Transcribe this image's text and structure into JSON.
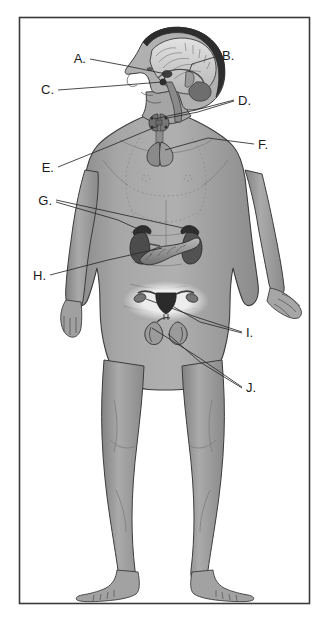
{
  "figure": {
    "background_color": "#ffffff",
    "frame": {
      "name": "figure-border",
      "x": 19,
      "y": 17,
      "width": 291,
      "height": 587,
      "stroke_color": "#3a3a3a",
      "stroke_width": 1.6,
      "fill_color": "#ffffff"
    },
    "palette": {
      "skin_base": "#9b9b9b",
      "skin_light": "#b4b4b4",
      "skin_shadow": "#7d7d7d",
      "skin_highlight": "#c6c6c6",
      "outline": "#3c3c3c",
      "organ_dark": "#4a4a4a",
      "organ_mid": "#6f6f6f",
      "organ_light": "#cfcfcf",
      "brain_light": "#d3d3d3",
      "hair_dark": "#2a2a2a",
      "halo": "#e8e8e8",
      "label_color": "#1a1a1a",
      "leader_color": "#2b2b2b",
      "dotted_guide": "#848484"
    },
    "labels": [
      {
        "id": "A",
        "text": "A.",
        "x": 86,
        "y": 62,
        "anchor": "end",
        "target_x": 167,
        "target_y": 74,
        "organ": "hypothalamus"
      },
      {
        "id": "B",
        "text": "B.",
        "x": 222,
        "y": 60,
        "anchor": "start",
        "target_x": 163,
        "target_y": 75,
        "organ": "pineal-gland"
      },
      {
        "id": "C",
        "text": "C.",
        "x": 52,
        "y": 94,
        "anchor": "end",
        "target_x": 162,
        "target_y": 73,
        "organ": "pituitary-gland"
      },
      {
        "id": "D",
        "text": "D.",
        "x": 238,
        "y": 104,
        "anchor": "start",
        "target_x": 156,
        "target_y": 123,
        "organ": "parathyroid-glands"
      },
      {
        "id": "E",
        "text": "E.",
        "x": 52,
        "y": 172,
        "anchor": "end",
        "target_x": 159,
        "target_y": 124,
        "organ": "thyroid-gland"
      },
      {
        "id": "F",
        "text": "F.",
        "x": 258,
        "y": 148,
        "anchor": "start",
        "target_x": 158,
        "target_y": 133,
        "organ": "thymus"
      },
      {
        "id": "G",
        "text": "G.",
        "x": 50,
        "y": 205,
        "anchor": "end",
        "target_x": 181,
        "target_y": 230,
        "organ": "adrenal-glands"
      },
      {
        "id": "H",
        "text": "H.",
        "x": 44,
        "y": 280,
        "anchor": "end",
        "target_x": 159,
        "target_y": 243,
        "organ": "pancreas"
      },
      {
        "id": "I",
        "text": "I.",
        "x": 246,
        "y": 337,
        "anchor": "start",
        "target_x": 148,
        "target_y": 303,
        "organ": "ovaries"
      },
      {
        "id": "J",
        "text": "J.",
        "x": 246,
        "y": 392,
        "anchor": "start",
        "target_x": 152,
        "target_y": 326,
        "organ": "testes"
      }
    ],
    "organs": [
      {
        "name": "hypothalamus",
        "region": "brain-sagittal-section"
      },
      {
        "name": "pineal-gland",
        "region": "brain-sagittal-section"
      },
      {
        "name": "pituitary-gland",
        "region": "brain-sagittal-section"
      },
      {
        "name": "thyroid-gland",
        "region": "neck"
      },
      {
        "name": "parathyroid-glands",
        "region": "neck"
      },
      {
        "name": "thymus",
        "region": "upper-chest"
      },
      {
        "name": "adrenal-glands",
        "region": "abdomen-superior-to-kidneys"
      },
      {
        "name": "pancreas",
        "region": "abdomen"
      },
      {
        "name": "ovaries",
        "region": "pelvis"
      },
      {
        "name": "testes",
        "region": "pelvis"
      }
    ],
    "leader_lines": [
      {
        "id": "A",
        "points": "90,60 120,66 166,74"
      },
      {
        "id": "B",
        "points": "218,57 190,64 164,74"
      },
      {
        "id": "C",
        "points": "57,90 110,82 161,73"
      },
      {
        "id": "D",
        "points": "234,101 195,110 157,122"
      },
      {
        "id": "E",
        "points": "57,168 110,146 158,124"
      },
      {
        "id": "F",
        "points": "254,145 205,139 159,133"
      },
      {
        "id": "G1",
        "points": "55,201 118,215 180,229"
      },
      {
        "id": "G2",
        "points": "55,203 120,221 144,229"
      },
      {
        "id": "H",
        "points": "49,276 105,260 158,244"
      },
      {
        "id": "I1",
        "points": "242,333 196,318 150,303"
      },
      {
        "id": "I2",
        "points": "242,334 200,324 171,312"
      },
      {
        "id": "J1",
        "points": "242,388 198,357 154,326"
      },
      {
        "id": "J2",
        "points": "242,389 200,362 165,329"
      }
    ]
  }
}
